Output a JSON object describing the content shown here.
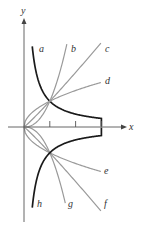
{
  "diagram": {
    "axes": {
      "x_label": "x",
      "y_label": "y"
    },
    "origin_px": [
      24,
      127
    ],
    "unit_px": 25.8,
    "ticks_x": [
      1,
      2,
      3
    ],
    "curves": [
      {
        "label": "a",
        "kind": "reciprocal",
        "sign": 1,
        "color": "#1a1a1a",
        "label_pos": [
          39,
          52
        ]
      },
      {
        "label": "b",
        "kind": "power",
        "p": 2.3,
        "sign": 1,
        "xmax": 1.66,
        "color": "#9a9a9a",
        "label_pos": [
          71,
          52
        ]
      },
      {
        "label": "c",
        "kind": "power",
        "p": 1.08,
        "sign": 1,
        "xmax": 2.98,
        "color": "#9a9a9a",
        "label_pos": [
          105,
          52
        ]
      },
      {
        "label": "d",
        "kind": "power",
        "p": 0.5,
        "sign": 1,
        "xmax": 2.98,
        "color": "#9a9a9a",
        "label_pos": [
          105,
          84
        ]
      },
      {
        "label": "e",
        "kind": "power",
        "p": 0.5,
        "sign": -1,
        "xmax": 2.98,
        "color": "#9a9a9a",
        "label_pos": [
          104,
          174
        ]
      },
      {
        "label": "f",
        "kind": "power",
        "p": 1.08,
        "sign": -1,
        "xmax": 2.98,
        "color": "#9a9a9a",
        "label_pos": [
          104,
          207
        ]
      },
      {
        "label": "g",
        "kind": "power",
        "p": 2.3,
        "sign": -1,
        "xmax": 1.6,
        "color": "#9a9a9a",
        "label_pos": [
          68,
          207
        ]
      },
      {
        "label": "h",
        "kind": "reciprocal",
        "sign": -1,
        "color": "#1a1a1a",
        "label_pos": [
          37,
          207
        ]
      }
    ]
  }
}
